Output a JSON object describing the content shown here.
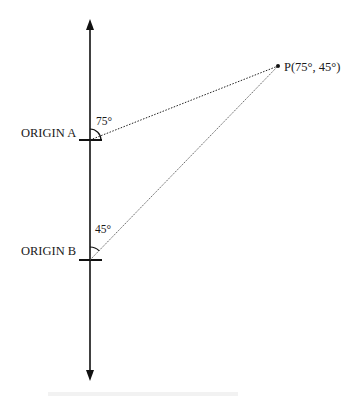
{
  "diagram": {
    "type": "bearing-triangulation",
    "axis": {
      "direction": "vertical",
      "arrows": [
        "up",
        "down"
      ]
    },
    "origins": [
      {
        "id": "A",
        "label": "ORIGIN A",
        "angle_label": "75°",
        "angle_deg": 75
      },
      {
        "id": "B",
        "label": "ORIGIN B",
        "angle_label": "45°",
        "angle_deg": 45
      }
    ],
    "point": {
      "label": "P(75°, 45°)",
      "coords": [
        75,
        45
      ]
    },
    "colors": {
      "line": "#111111",
      "background": "#ffffff"
    }
  }
}
